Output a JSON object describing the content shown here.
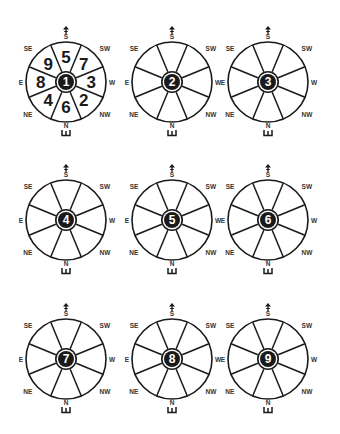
{
  "diagram": {
    "layout": {
      "columns_x": [
        66,
        172,
        268
      ],
      "rows_y": [
        82,
        220,
        359
      ],
      "radius": 40,
      "center_outer_radius": 11,
      "center_inner_radius": 8
    },
    "colors": {
      "line": "#1a1a1a",
      "fill": "#ffffff",
      "center_fill": "#1a1a1a",
      "center_text": "#ffffff",
      "label": "#333333"
    },
    "directions": {
      "top": "S",
      "top_right": "SW",
      "right": "W",
      "bottom_right": "NW",
      "bottom": "N",
      "bottom_left": "NE",
      "left": "E",
      "top_left": "SE"
    },
    "top_icon": "up-arrow-icon",
    "bottom_icon": "comb-gate-icon",
    "charts": [
      {
        "center": "1",
        "sectors": {
          "S": "5",
          "SW": "7",
          "W": "3",
          "NW": "2",
          "N": "6",
          "NE": "4",
          "E": "8",
          "SE": "9"
        }
      },
      {
        "center": "2",
        "sectors": {}
      },
      {
        "center": "3",
        "sectors": {}
      },
      {
        "center": "4",
        "sectors": {}
      },
      {
        "center": "5",
        "sectors": {}
      },
      {
        "center": "6",
        "sectors": {}
      },
      {
        "center": "7",
        "sectors": {}
      },
      {
        "center": "8",
        "sectors": {}
      },
      {
        "center": "9",
        "sectors": {}
      }
    ]
  }
}
